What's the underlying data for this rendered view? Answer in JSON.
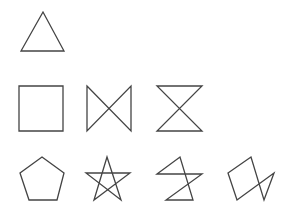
{
  "diagram": {
    "title": "",
    "stroke_color": "#444444",
    "background_color": "#ffffff",
    "rows": [
      {
        "name": "row-1",
        "shapes": [
          {
            "name": "triangle",
            "description": "equilateral triangle"
          }
        ]
      },
      {
        "name": "row-2",
        "shapes": [
          {
            "name": "square",
            "description": "square"
          },
          {
            "name": "bowtie",
            "description": "square with two vertical sides and crossed diagonals (bowtie)"
          },
          {
            "name": "hourglass",
            "description": "square with two horizontal sides and crossed diagonals (hourglass)"
          }
        ]
      },
      {
        "name": "row-3",
        "shapes": [
          {
            "name": "pentagon",
            "description": "regular pentagon"
          },
          {
            "name": "pentagram",
            "description": "five-pointed star"
          },
          {
            "name": "zigzag-pentagon-path",
            "description": "self-intersecting five-vertex closed path"
          },
          {
            "name": "tilted-pentagon-path",
            "description": "tilted self-intersecting five-vertex closed path"
          }
        ]
      }
    ]
  }
}
